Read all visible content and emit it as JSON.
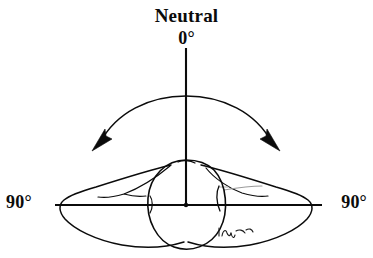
{
  "figure": {
    "kind": "anatomical-range-of-motion-diagram",
    "title": "Neutral",
    "background_color": "#ffffff",
    "ink_color": "#0b0b0b",
    "faint_ink_color": "#8f8f8f",
    "labels": {
      "top_title": "Neutral",
      "top_angle": "0°",
      "left_angle": "90°",
      "right_angle": "90°"
    },
    "axes": {
      "vertical_axis_name": "neutral-0-degree-axis",
      "horizontal_axis_name": "90-degree-reference-axis",
      "origin": {
        "x": 186,
        "y": 205
      },
      "vertical_top": {
        "x": 186,
        "y": 48
      },
      "horizontal_left": {
        "x": 55,
        "y": 205
      },
      "horizontal_right": {
        "x": 322,
        "y": 205
      }
    },
    "motion_arc": {
      "name": "rotation-range-arc",
      "double_headed": true,
      "apex": {
        "x": 186,
        "y": 97
      },
      "left_arrow_tip": {
        "x": 92,
        "y": 150
      },
      "right_arrow_tip": {
        "x": 279,
        "y": 150
      },
      "sweep_description": "double-headed arc spanning left 90° to right 90° about the neutral axis"
    },
    "anatomy": {
      "center_oval_name": "central-body-oval",
      "left_wing_name": "left-lateral-lobe",
      "right_wing_name": "right-lateral-lobe"
    },
    "signature": {
      "name": "artist-signature",
      "text": "",
      "position": {
        "x": 228,
        "y": 232
      },
      "legible": false
    }
  }
}
